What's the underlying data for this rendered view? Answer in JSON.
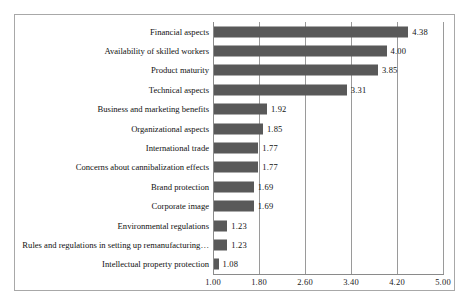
{
  "chart_data": {
    "type": "bar",
    "orientation": "horizontal",
    "title": "",
    "subtitle": "",
    "xlabel": "",
    "ylabel": "",
    "xlim": [
      1.0,
      5.0
    ],
    "grid": true,
    "legend": null,
    "bar_color": "#595959",
    "xticks": [
      "1.00",
      "1.80",
      "2.60",
      "3.40",
      "4.20",
      "5.00"
    ],
    "xtick_values": [
      1.0,
      1.8,
      2.6,
      3.4,
      4.2,
      5.0
    ],
    "categories": [
      "Financial aspects",
      "Availability of skilled workers",
      "Product maturity",
      "Technical aspects",
      "Business and marketing benefits",
      "Organizational aspects",
      "International trade",
      "Concerns about cannibalization effects",
      "Brand protection",
      "Corporate image",
      "Environmental regulations",
      "Rules and regulations in setting up remanufacturing…",
      "Intellectual property protection"
    ],
    "values": [
      4.38,
      4.0,
      3.85,
      3.31,
      1.92,
      1.85,
      1.77,
      1.77,
      1.69,
      1.69,
      1.23,
      1.23,
      1.08
    ],
    "value_labels": [
      "4.38",
      "4.00",
      "3.85",
      "3.31",
      "1.92",
      "1.85",
      "1.77",
      "1.77",
      "1.69",
      "1.69",
      "1.23",
      "1.23",
      "1.08"
    ]
  }
}
